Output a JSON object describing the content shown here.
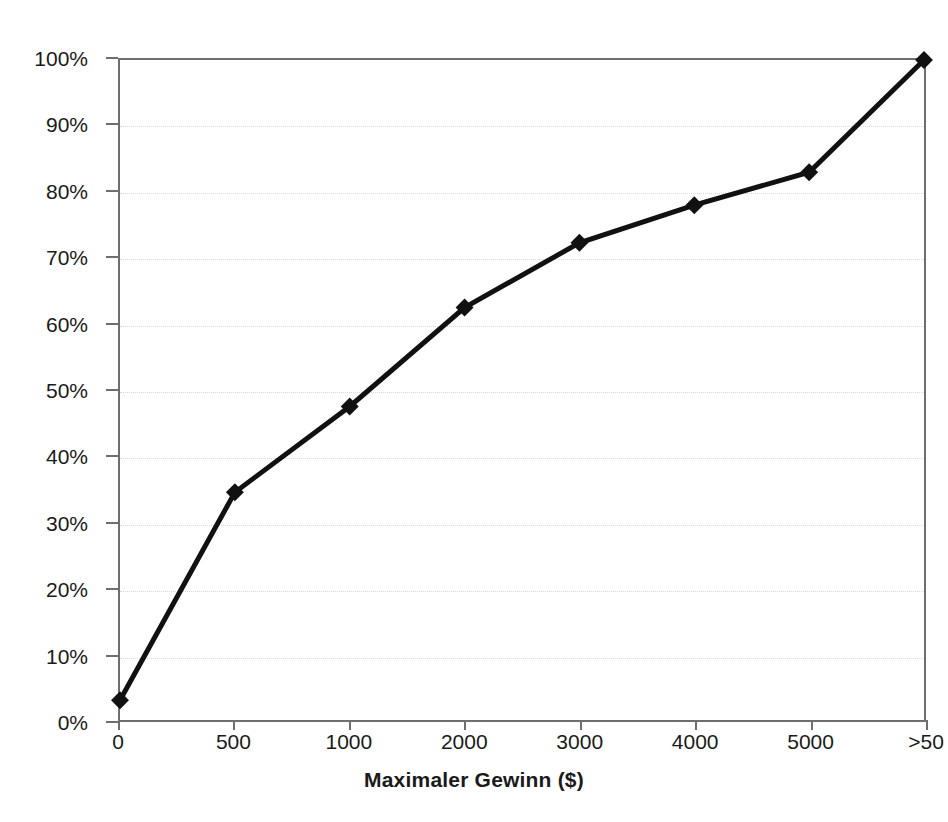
{
  "chart_data": {
    "type": "line",
    "title": "",
    "subtitle": "",
    "xlabel": "Maximaler Gewinn ($)",
    "ylabel": "",
    "categories": [
      "0",
      "500",
      "1000",
      "2000",
      "3000",
      "4000",
      "5000",
      ">5000"
    ],
    "category_labels_rendered": [
      "0",
      "500",
      "1000",
      "2000",
      "3000",
      "4000",
      "5000",
      ">50"
    ],
    "values": [
      3,
      34.5,
      47.5,
      62.5,
      72.3,
      78,
      83,
      100
    ],
    "value_unit": "%",
    "ylim": [
      0,
      100
    ],
    "ytick_values": [
      0,
      10,
      20,
      30,
      40,
      50,
      60,
      70,
      80,
      90,
      100
    ],
    "ytick_labels": [
      "0%",
      "10%",
      "20%",
      "30%",
      "40%",
      "50%",
      "60%",
      "70%",
      "80%",
      "90%",
      "100%"
    ],
    "grid": true,
    "grid_axis": "y",
    "grid_style": "dotted",
    "legend": false,
    "legend_position": "none",
    "marker": "diamond",
    "series": [
      {
        "name": "Kumulierter Anteil",
        "values": [
          3,
          34.5,
          47.5,
          62.5,
          72.3,
          78,
          83,
          100
        ]
      }
    ],
    "annotations": []
  },
  "style": {
    "line_color": "#111111",
    "marker_color": "#111111",
    "grid_color": "#d8d8d8",
    "axis_color": "#6e6e6e",
    "text_color": "#1a1a1a",
    "background": "#ffffff",
    "line_width": 5,
    "marker_size": 9
  }
}
